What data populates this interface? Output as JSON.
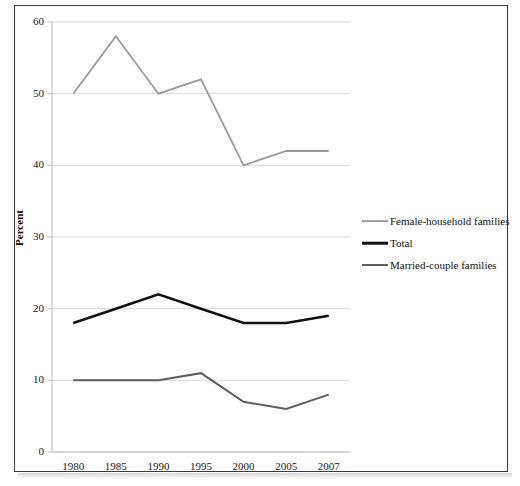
{
  "chart_data": {
    "type": "line",
    "title": "",
    "xlabel": "",
    "ylabel": "Percent",
    "categories": [
      "1980",
      "1985",
      "1990",
      "1995",
      "2000",
      "2005",
      "2007"
    ],
    "x": [
      1980,
      1985,
      1990,
      1995,
      2000,
      2005,
      2007
    ],
    "ylim": [
      0,
      60
    ],
    "ytick_labels": [
      "0",
      "10",
      "20",
      "30",
      "40",
      "50",
      "60"
    ],
    "yticks": [
      0,
      10,
      20,
      30,
      40,
      50,
      60
    ],
    "grid": "horizontal",
    "legend_position": "right-outside",
    "series": [
      {
        "name": "Female-household families",
        "values": [
          50,
          58,
          50,
          52,
          40,
          42,
          42
        ],
        "color": "#9a9a9a",
        "line_width": 1.8
      },
      {
        "name": "Total",
        "values": [
          18,
          20,
          22,
          20,
          18,
          18,
          19
        ],
        "color": "#111111",
        "line_width": 2.6
      },
      {
        "name": "Married-couple families",
        "values": [
          10,
          10,
          10,
          11,
          7,
          6,
          8
        ],
        "color": "#5e5e5e",
        "line_width": 2.0
      }
    ]
  },
  "colors": {
    "frame_border": "#3a3a3a",
    "gridline": "#d7d7d7",
    "axis_line": "#bfbfbf",
    "text": "#1a1a1a"
  },
  "legend": {
    "items": [
      {
        "label": "Female-household families"
      },
      {
        "label": "Total"
      },
      {
        "label": "Married-couple families"
      }
    ]
  }
}
